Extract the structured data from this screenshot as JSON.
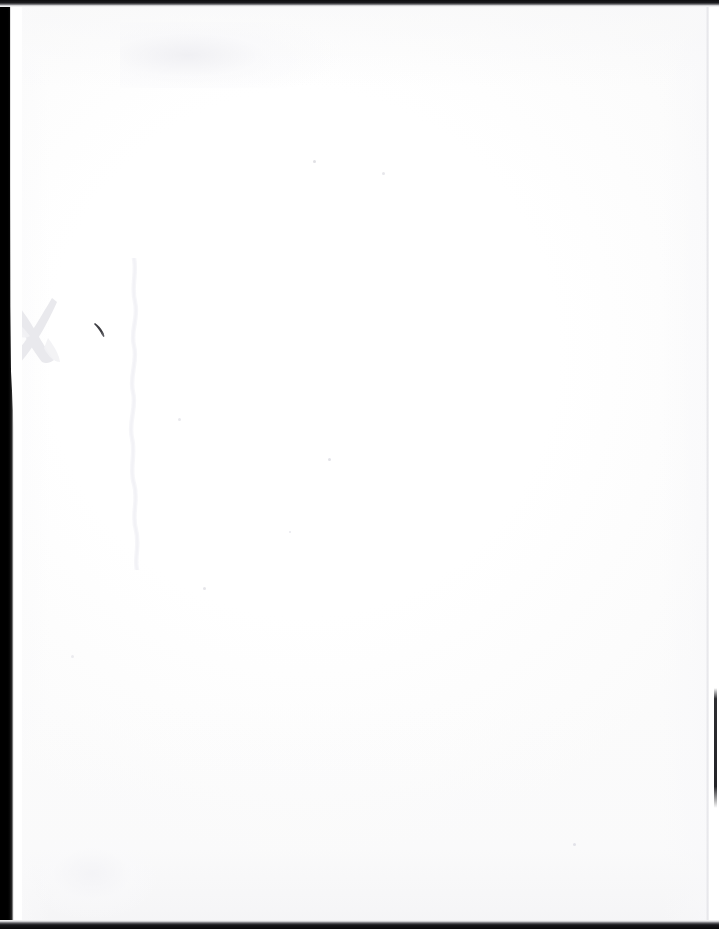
{
  "document": {
    "kind": "scanned-page",
    "page_state": "blank",
    "visible_text": "",
    "width_px": 719,
    "height_px": 929
  },
  "page": {
    "paper_color": "#ffffff",
    "paper_tone_color": "#fbfbfb",
    "sheet_left_px": 9,
    "sheet_top_px": 5,
    "sheet_width_px": 700,
    "sheet_height_px": 917
  },
  "scan_borders": {
    "left": {
      "label": "left scanner border",
      "color": "#000000",
      "width_px": 19
    },
    "top": {
      "label": "top scanner border",
      "color": "#0d0d0f",
      "height_px": 7
    },
    "bottom": {
      "label": "bottom scanner border",
      "color": "#08080a",
      "height_px": 9
    },
    "right_page_edge": {
      "label": "right page edge",
      "color": "#e2e2e6",
      "width_px": 3
    },
    "right_dark_segment": {
      "label": "right edge dark segment",
      "color": "#1c1c20",
      "top_px": 688,
      "height_px": 120
    }
  },
  "marks": {
    "x_mark": {
      "label": "faint gray X mark",
      "color": "#e9e9ec",
      "x_px": 2,
      "y_px": 288,
      "width_px": 62,
      "height_px": 84
    },
    "tick_mark": {
      "label": "small dark tick mark",
      "color": "#3a3a3e",
      "x_px": 93,
      "y_px": 320,
      "width_px": 16,
      "height_px": 18
    },
    "crease": {
      "label": "faint vertical crease",
      "color": "#ededf0",
      "x_px": 118,
      "y_px": 258,
      "height_px": 312
    },
    "ghost_bleed": {
      "label": "faint bleed-through ghosting",
      "color": "#eeeef2",
      "x_px": 120,
      "y_px": 22
    },
    "smudge_bottom_left": {
      "label": "faint smudge",
      "color": "#f3f3f6",
      "x_px": 40,
      "y_px": 838
    }
  },
  "specks": [
    {
      "label": "speck",
      "x_px": 313,
      "y_px": 160
    },
    {
      "label": "speck",
      "x_px": 382,
      "y_px": 172
    },
    {
      "label": "speck",
      "x_px": 328,
      "y_px": 458
    },
    {
      "label": "speck",
      "x_px": 289,
      "y_px": 531
    },
    {
      "label": "speck",
      "x_px": 203,
      "y_px": 587
    },
    {
      "label": "speck",
      "x_px": 573,
      "y_px": 843
    },
    {
      "label": "speck",
      "x_px": 71,
      "y_px": 655
    },
    {
      "label": "speck",
      "x_px": 178,
      "y_px": 418
    }
  ]
}
